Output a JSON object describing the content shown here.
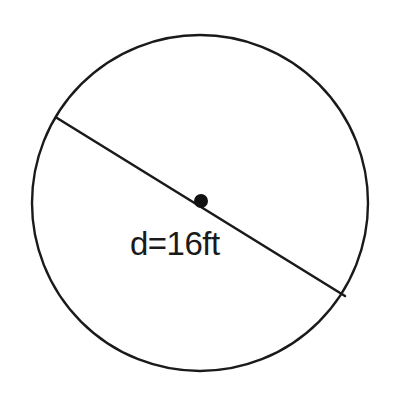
{
  "figure": {
    "kind": "geometry-diagram",
    "background_color": "#ffffff",
    "stroke_color": "#1a1a1a",
    "label": "d=16ft",
    "measurement": {
      "symbol": "d",
      "value": "16",
      "unit": "ft",
      "meaning": "diameter"
    },
    "circle": {
      "center_x": 200,
      "center_y": 203,
      "radius": 168,
      "stroke_width": 2.4,
      "fill": "none"
    },
    "diameter_line": {
      "x1": 57,
      "y1": 118,
      "x2": 345,
      "y2": 296,
      "stroke_width": 2.6
    },
    "center_dot": {
      "cx": 201,
      "cy": 201,
      "r": 7,
      "fill": "#111111"
    },
    "label_position": {
      "x": 130,
      "y": 255,
      "font_size": 33
    }
  }
}
